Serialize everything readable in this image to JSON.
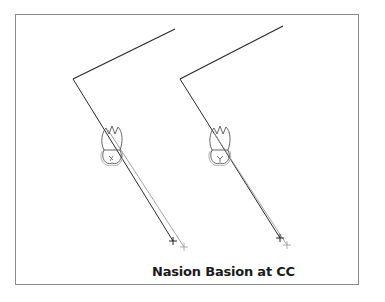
{
  "figure": {
    "caption": "Nasion Basion at CC",
    "colors": {
      "frame": "#8a8a8a",
      "primary_line": "#2a2a2a",
      "secondary_line": "#9a9a9a",
      "tooth_outline": "#555555"
    },
    "panels": [
      {
        "name": "left",
        "vertex": [
          73,
          79
        ],
        "upper_end": [
          175,
          29
        ],
        "lower_end_primary": [
          173,
          241
        ],
        "lower_end_secondary": [
          184,
          247
        ],
        "tooth_center": [
          112,
          142
        ],
        "markers": [
          "cross-dark",
          "cross-light"
        ]
      },
      {
        "name": "right",
        "vertex": [
          180,
          79
        ],
        "upper_end": [
          283,
          26
        ],
        "lower_end_primary": [
          280,
          238
        ],
        "lower_end_secondary": [
          287,
          245
        ],
        "tooth_center": [
          220,
          142
        ],
        "markers": [
          "cross-dark",
          "cross-light"
        ]
      }
    ]
  }
}
